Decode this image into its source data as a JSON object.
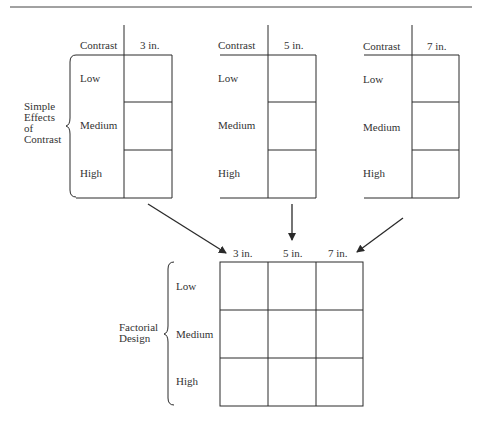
{
  "diagram": {
    "type": "factorial-design-illustration",
    "simple_effects": {
      "label_lines": [
        "Simple",
        "Effects",
        "of",
        "Contrast"
      ],
      "tables": [
        {
          "header_left": "Contrast",
          "header_right": "3 in.",
          "rows": [
            "Low",
            "Medium",
            "High"
          ]
        },
        {
          "header_left": "Contrast",
          "header_right": "5 in.",
          "rows": [
            "Low",
            "Medium",
            "High"
          ]
        },
        {
          "header_left": "Contrast",
          "header_right": "7 in.",
          "rows": [
            "Low",
            "Medium",
            "High"
          ]
        }
      ]
    },
    "factorial": {
      "label_lines": [
        "Factorial",
        "Design"
      ],
      "columns": [
        "3 in.",
        "5 in.",
        "7 in."
      ],
      "rows": [
        "Low",
        "Medium",
        "High"
      ]
    },
    "arrows": [
      {
        "from": "table-3in",
        "to": "column-3in"
      },
      {
        "from": "table-5in",
        "to": "column-5in"
      },
      {
        "from": "table-7in",
        "to": "column-7in"
      }
    ],
    "colors": {
      "line": "#2a2a2a",
      "text": "#333333",
      "background": "#ffffff"
    }
  }
}
